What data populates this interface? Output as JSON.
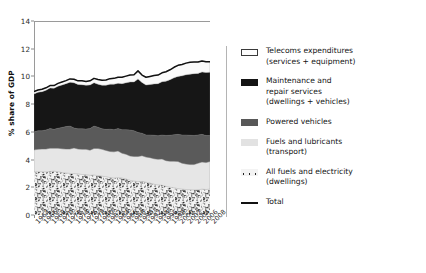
{
  "chart_data": {
    "type": "area",
    "title": "",
    "xlabel": "",
    "ylabel": "% share of GDP",
    "ylim": [
      0,
      14
    ],
    "yticks": [
      0,
      2,
      4,
      6,
      8,
      10,
      12,
      14
    ],
    "xlim": [
      1964,
      2008
    ],
    "grid": false,
    "legend_position": "right",
    "stacked": true,
    "x": [
      1964,
      1965,
      1966,
      1967,
      1968,
      1969,
      1970,
      1971,
      1972,
      1973,
      1974,
      1975,
      1976,
      1977,
      1978,
      1979,
      1980,
      1981,
      1982,
      1983,
      1984,
      1985,
      1986,
      1987,
      1988,
      1989,
      1990,
      1991,
      1992,
      1993,
      1994,
      1995,
      1996,
      1997,
      1998,
      1999,
      2000,
      2001,
      2002,
      2003,
      2004,
      2005,
      2006,
      2007,
      2008
    ],
    "xtick_labels": [
      "1964",
      "1966",
      "1968",
      "1970",
      "1972",
      "1974",
      "1976",
      "1978",
      "1980",
      "1982",
      "1984",
      "1986",
      "1988",
      "1990",
      "1992",
      "1994",
      "1996",
      "1998",
      "2000",
      "2002",
      "2004",
      "2006",
      "2008"
    ],
    "series": [
      {
        "name": "All fuels and electricity (dwellings)",
        "color": "#f0f0f0",
        "pattern": "speckled",
        "values": [
          3.1,
          3.12,
          3.12,
          3.1,
          3.14,
          3.16,
          3.12,
          3.06,
          3.02,
          3.0,
          2.98,
          2.96,
          2.92,
          2.9,
          2.86,
          2.88,
          2.84,
          2.8,
          2.76,
          2.7,
          2.66,
          2.7,
          2.66,
          2.6,
          2.5,
          2.44,
          2.4,
          2.42,
          2.36,
          2.3,
          2.22,
          2.16,
          2.14,
          2.06,
          2.0,
          1.96,
          1.9,
          1.86,
          1.84,
          1.82,
          1.8,
          1.82,
          1.86,
          1.84,
          1.86
        ]
      },
      {
        "name": "Fuels and lubricants (transport)",
        "color": "#e6e6e6",
        "values": [
          1.6,
          1.62,
          1.64,
          1.66,
          1.68,
          1.66,
          1.7,
          1.72,
          1.74,
          1.76,
          1.86,
          1.8,
          1.82,
          1.84,
          1.82,
          1.92,
          1.96,
          1.94,
          1.9,
          1.88,
          1.9,
          1.92,
          1.8,
          1.78,
          1.76,
          1.78,
          1.82,
          1.86,
          1.82,
          1.84,
          1.84,
          1.86,
          1.9,
          1.86,
          1.88,
          1.92,
          1.96,
          1.88,
          1.84,
          1.82,
          1.84,
          1.92,
          1.96,
          1.94,
          2.0
        ]
      },
      {
        "name": "Powered vehicles",
        "color": "#5a5a5a",
        "values": [
          1.3,
          1.34,
          1.32,
          1.38,
          1.42,
          1.36,
          1.44,
          1.54,
          1.62,
          1.66,
          1.44,
          1.46,
          1.48,
          1.46,
          1.56,
          1.62,
          1.54,
          1.48,
          1.52,
          1.62,
          1.6,
          1.62,
          1.7,
          1.78,
          1.88,
          1.86,
          1.74,
          1.62,
          1.6,
          1.64,
          1.7,
          1.7,
          1.74,
          1.82,
          1.88,
          1.92,
          1.96,
          2.04,
          2.1,
          2.12,
          2.1,
          2.04,
          2.0,
          1.96,
          1.88
        ]
      },
      {
        "name": "Maintenance and repair services (dwellings + vehicles)",
        "color": "#161616",
        "values": [
          2.74,
          2.78,
          2.82,
          2.86,
          2.92,
          2.96,
          3.04,
          3.06,
          3.1,
          3.16,
          3.26,
          3.2,
          3.18,
          3.16,
          3.14,
          3.12,
          3.1,
          3.14,
          3.18,
          3.24,
          3.28,
          3.26,
          3.32,
          3.38,
          3.46,
          3.52,
          3.86,
          3.66,
          3.6,
          3.64,
          3.7,
          3.76,
          3.84,
          3.92,
          4.0,
          4.1,
          4.18,
          4.26,
          4.34,
          4.4,
          4.46,
          4.44,
          4.5,
          4.54,
          4.56
        ]
      },
      {
        "name": "Telecoms expenditures (services + equipment)",
        "color": "#fafafa",
        "values": [
          0.16,
          0.16,
          0.18,
          0.18,
          0.18,
          0.2,
          0.2,
          0.22,
          0.22,
          0.24,
          0.26,
          0.26,
          0.28,
          0.28,
          0.3,
          0.32,
          0.34,
          0.36,
          0.38,
          0.4,
          0.42,
          0.44,
          0.46,
          0.48,
          0.5,
          0.52,
          0.58,
          0.54,
          0.56,
          0.58,
          0.6,
          0.62,
          0.64,
          0.68,
          0.72,
          0.76,
          0.8,
          0.82,
          0.84,
          0.86,
          0.84,
          0.82,
          0.8,
          0.78,
          0.76
        ]
      }
    ],
    "total": {
      "name": "Total",
      "color": "#111111",
      "values": [
        8.9,
        9.02,
        9.08,
        9.18,
        9.34,
        9.34,
        9.5,
        9.6,
        9.7,
        9.82,
        9.8,
        9.68,
        9.68,
        9.64,
        9.68,
        9.86,
        9.78,
        9.72,
        9.74,
        9.84,
        9.86,
        9.94,
        9.94,
        10.02,
        10.1,
        10.12,
        10.4,
        10.1,
        9.94,
        10.0,
        10.06,
        10.1,
        10.26,
        10.34,
        10.48,
        10.66,
        10.8,
        10.86,
        10.96,
        11.02,
        11.04,
        11.04,
        11.12,
        11.06,
        11.06
      ]
    }
  },
  "axis": {
    "y_title": "% share of GDP",
    "y_ticks": [
      "0",
      "2",
      "4",
      "6",
      "8",
      "10",
      "12",
      "14"
    ],
    "x_ticks": [
      "1964",
      "1966",
      "1968",
      "1970",
      "1972",
      "1974",
      "1976",
      "1978",
      "1980",
      "1982",
      "1984",
      "1986",
      "1988",
      "1990",
      "1992",
      "1994",
      "1996",
      "1998",
      "2000",
      "2002",
      "2004",
      "2006",
      "2008"
    ]
  },
  "legend": {
    "items": [
      {
        "label_line1": "Telecoms expenditures",
        "label_line2": "(services + equipment)",
        "swatch": "sw-telecom"
      },
      {
        "label_line1": "Maintenance and",
        "label_line2": "repair services",
        "label_line3": "(dwellings + vehicles)",
        "swatch": "sw-maint"
      },
      {
        "label_line1": "Powered vehicles",
        "label_line2": "",
        "swatch": "sw-vehicles"
      },
      {
        "label_line1": "Fuels and lubricants",
        "label_line2": "(transport)",
        "swatch": "sw-fuelstr"
      },
      {
        "label_line1": "All fuels and electricity",
        "label_line2": "(dwellings)",
        "swatch": "sw-dwell"
      },
      {
        "label_line1": "Total",
        "label_line2": "",
        "swatch": "sw-total"
      }
    ]
  }
}
